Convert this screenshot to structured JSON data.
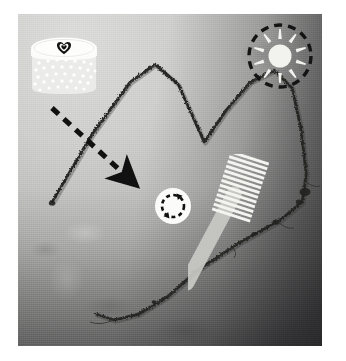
{
  "image": {
    "domain": "Natural-Image",
    "kind": "photograph-with-icon-overlays",
    "caption": "A single dark hair strand arranged in a zigzag mountain shape on light gray woven fabric, annotated with hair-care icons",
    "frame": {
      "background_color": "#ffffff",
      "photo_left": 18,
      "photo_top": 14,
      "photo_width": 304,
      "photo_height": 332
    }
  },
  "colors": {
    "paper_white": "#ffffff",
    "fabric_light": "#d9d9d7",
    "fabric_mid": "#b3b3b1",
    "fabric_dark": "#6a6a69",
    "hair_dark": "#2b2a28",
    "ink_black": "#111111",
    "icon_white": "#f6f6f4",
    "jar_body": "#ececea",
    "jar_lid": "#fbfbf9",
    "brush_handle": "#c9c9c5",
    "bristle_white": "#f4f4f1"
  },
  "subject": {
    "name": "hair-strand",
    "label": "hair strand",
    "shape": "zigzag / double-peak M curve",
    "stroke_color": "#2b2a28",
    "path": "M 34 188 L 74 120 L 112 68 L 137 50 L 160 70 L 186 128 L 208 96 L 232 68 L 256 56 L 274 74 L 283 116 L 288 160 L 284 188 L 262 206 L 222 228 L 182 254 L 150 282 L 120 300 L 96 306 L 78 300"
  },
  "overlays": [
    {
      "id": "jar",
      "name": "hair-mask-jar",
      "label": "cosmetic jar",
      "detail": "white cylindrical tub with dotted body and a heart stamped on the lid",
      "icon": "jar-icon",
      "lid_mark": "heart-icon",
      "dot_count": 44,
      "x": 8,
      "y": 18,
      "w": 76,
      "h": 68
    },
    {
      "id": "arrow",
      "name": "dashed-arrow",
      "label": "dashed arrow",
      "detail": "black dashed arrow pointing down-right from the jar toward the hair strand",
      "icon": "arrow-down-right-icon",
      "direction": "down-right",
      "dash_pattern": "9 7",
      "color": "#111111",
      "x": 22,
      "y": 84,
      "w": 110,
      "h": 96
    },
    {
      "id": "refresh",
      "name": "refresh-badge",
      "label": "refresh cycle badge",
      "detail": "white disc holding a dashed circular two-headed arrow",
      "icon": "refresh-circle-icon",
      "arrowheads": 2,
      "x": 131,
      "y": 168,
      "w": 48,
      "h": 48
    },
    {
      "id": "brush",
      "name": "hair-brush",
      "label": "brush / comb",
      "detail": "white striped bristle head on a long pale handle angled down-right",
      "icon": "brush-icon",
      "bristle_rows": 13,
      "x": 170,
      "y": 140,
      "w": 120,
      "h": 160
    },
    {
      "id": "sun",
      "name": "sun-badge",
      "label": "sun badge",
      "detail": "white sun with tapered rays inside a black dashed circle",
      "icon": "sun-icon",
      "ray_count": 10,
      "ring_style": "dashed",
      "x": 226,
      "y": 6,
      "w": 72,
      "h": 72
    }
  ]
}
